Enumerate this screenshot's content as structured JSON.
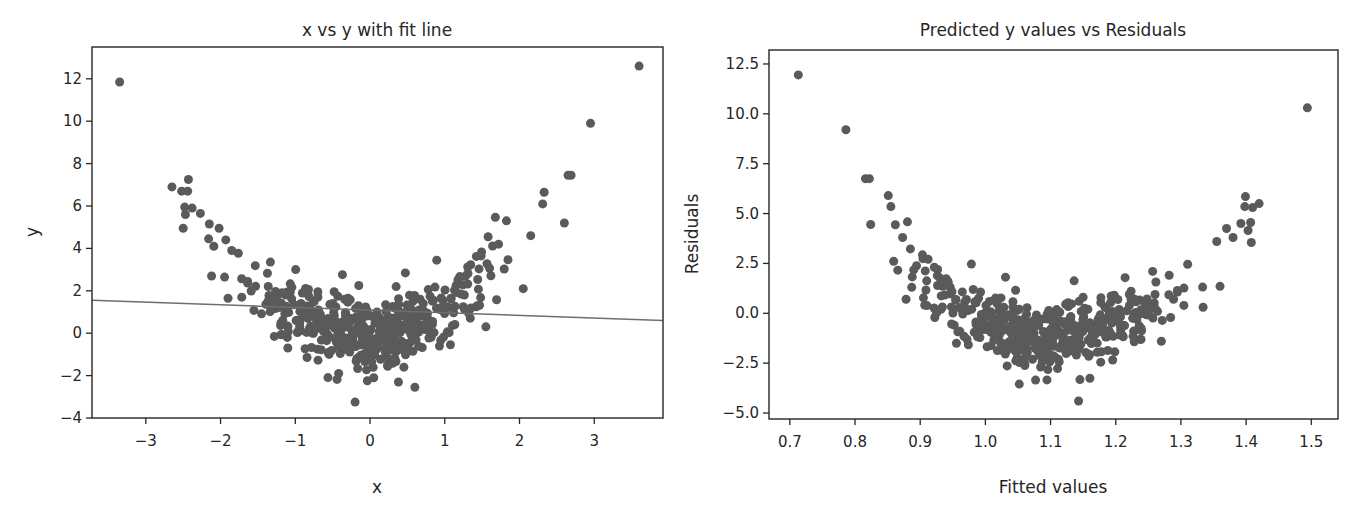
{
  "chart_data": [
    {
      "type": "scatter",
      "title": "x vs y with fit line",
      "xlabel": "x",
      "ylabel": "y",
      "xlim": [
        -3.72,
        3.92
      ],
      "ylim": [
        -4.0,
        13.5
      ],
      "xticks": [
        -3,
        -2,
        -1,
        0,
        1,
        2,
        3
      ],
      "xtick_labels": [
        "−3",
        "−2",
        "−1",
        "0",
        "1",
        "2",
        "3"
      ],
      "yticks": [
        -4,
        -2,
        0,
        2,
        4,
        6,
        8,
        10,
        12
      ],
      "ytick_labels": [
        "−4",
        "−2",
        "0",
        "2",
        "4",
        "6",
        "8",
        "10",
        "12"
      ],
      "grid": false,
      "legend": null,
      "point_color": "#5a5a5a",
      "line_color": "#6e6e6e",
      "fit_line": {
        "slope": -0.125,
        "intercept": 1.09,
        "x_range": [
          -3.72,
          3.92
        ]
      },
      "outlier_points": [
        {
          "x": -3.35,
          "y": 11.85
        },
        {
          "x": 3.6,
          "y": 12.6
        },
        {
          "x": 2.95,
          "y": 9.9
        },
        {
          "x": -2.65,
          "y": 6.9
        },
        {
          "x": -2.52,
          "y": 6.7
        },
        {
          "x": -2.43,
          "y": 7.25
        },
        {
          "x": -2.44,
          "y": 6.7
        },
        {
          "x": -2.48,
          "y": 5.95
        },
        {
          "x": -2.38,
          "y": 5.9
        },
        {
          "x": -2.47,
          "y": 5.6
        },
        {
          "x": -2.5,
          "y": 4.95
        },
        {
          "x": -2.27,
          "y": 5.65
        },
        {
          "x": -2.15,
          "y": 5.15
        },
        {
          "x": -2.16,
          "y": 4.45
        },
        {
          "x": -2.02,
          "y": 4.95
        },
        {
          "x": -2.09,
          "y": 4.1
        },
        {
          "x": -1.93,
          "y": 4.4
        },
        {
          "x": -1.85,
          "y": 3.9
        },
        {
          "x": -2.12,
          "y": 2.7
        },
        {
          "x": -1.9,
          "y": 1.65
        },
        {
          "x": 2.33,
          "y": 6.65
        },
        {
          "x": 2.31,
          "y": 6.1
        },
        {
          "x": 2.65,
          "y": 7.45
        },
        {
          "x": 2.69,
          "y": 7.45
        },
        {
          "x": 2.6,
          "y": 5.2
        },
        {
          "x": 2.15,
          "y": 4.6
        },
        {
          "x": 1.58,
          "y": 4.55
        },
        {
          "x": 1.72,
          "y": 4.2
        },
        {
          "x": 2.05,
          "y": 2.1
        },
        {
          "x": -1.28,
          "y": -0.15
        },
        {
          "x": -1.1,
          "y": -0.7
        },
        {
          "x": -0.42,
          "y": -1.9
        },
        {
          "x": -0.2,
          "y": -3.25
        },
        {
          "x": 0.38,
          "y": -2.3
        },
        {
          "x": 0.6,
          "y": -2.55
        },
        {
          "x": 0.05,
          "y": -2.1
        },
        {
          "x": -0.15,
          "y": 2.25
        },
        {
          "x": 1.42,
          "y": 1.25
        },
        {
          "x": 1.55,
          "y": 0.3
        }
      ],
      "cluster_model": {
        "description": "dense cloud following y = x^2 + noise, ~460 points",
        "count": 460,
        "x_mean": 0.0,
        "x_sd": 0.78,
        "x_clip": [
          -1.95,
          1.85
        ],
        "quad": 1.0,
        "noise_sd": 0.85,
        "seed": 7
      }
    },
    {
      "type": "scatter",
      "title": "Predicted y values vs Residuals",
      "xlabel": "Fitted values",
      "ylabel": "Residuals",
      "xlim": [
        0.668,
        1.541
      ],
      "ylim": [
        -5.3,
        13.2
      ],
      "xticks": [
        0.7,
        0.8,
        0.9,
        1.0,
        1.1,
        1.2,
        1.3,
        1.4,
        1.5
      ],
      "xtick_labels": [
        "0.7",
        "0.8",
        "0.9",
        "1.0",
        "1.1",
        "1.2",
        "1.3",
        "1.4",
        "1.5"
      ],
      "yticks": [
        -5.0,
        -2.5,
        0.0,
        2.5,
        5.0,
        7.5,
        10.0,
        12.5
      ],
      "ytick_labels": [
        "−5.0",
        "−2.5",
        "0.0",
        "2.5",
        "5.0",
        "7.5",
        "10.0",
        "12.5"
      ],
      "grid": false,
      "legend": null,
      "point_color": "#5a5a5a",
      "outlier_points": [
        {
          "x": 0.713,
          "y": 11.95
        },
        {
          "x": 0.786,
          "y": 9.2
        },
        {
          "x": 1.494,
          "y": 10.3
        },
        {
          "x": 0.816,
          "y": 6.75
        },
        {
          "x": 0.822,
          "y": 6.75
        },
        {
          "x": 0.824,
          "y": 4.45
        },
        {
          "x": 0.851,
          "y": 5.9
        },
        {
          "x": 0.855,
          "y": 5.35
        },
        {
          "x": 0.873,
          "y": 3.8
        },
        {
          "x": 1.399,
          "y": 5.85
        },
        {
          "x": 1.398,
          "y": 5.35
        },
        {
          "x": 1.41,
          "y": 5.3
        },
        {
          "x": 1.42,
          "y": 5.5
        },
        {
          "x": 1.392,
          "y": 4.5
        },
        {
          "x": 1.407,
          "y": 4.55
        },
        {
          "x": 1.403,
          "y": 4.15
        },
        {
          "x": 1.408,
          "y": 3.55
        },
        {
          "x": 1.37,
          "y": 4.25
        },
        {
          "x": 1.38,
          "y": 3.8
        },
        {
          "x": 1.355,
          "y": 3.6
        },
        {
          "x": 0.887,
          "y": 1.3
        },
        {
          "x": 1.36,
          "y": 1.35
        },
        {
          "x": 1.334,
          "y": 0.3
        },
        {
          "x": 1.27,
          "y": -1.4
        },
        {
          "x": 1.143,
          "y": -4.4
        },
        {
          "x": 1.052,
          "y": -3.55
        },
        {
          "x": 1.077,
          "y": -3.35
        }
      ],
      "cluster_model": {
        "description": "dense U-shaped cloud of residuals vs fitted values, ~460 points",
        "count": 460,
        "derived_from": "chart_data.0 cluster with fit line"
      }
    }
  ],
  "layout": {
    "left": {
      "box": [
        92,
        47,
        663,
        418
      ],
      "title_y": 30,
      "xlabel_y": 493,
      "ylabel_x": 33
    },
    "right": {
      "box": [
        769,
        50,
        1338,
        419
      ],
      "title_y": 30,
      "xlabel_y": 493,
      "ylabel_x": 692
    }
  }
}
